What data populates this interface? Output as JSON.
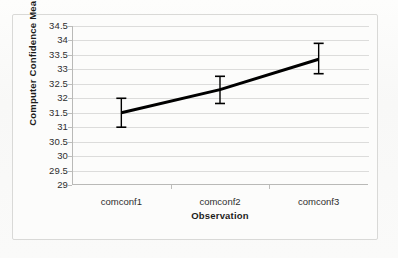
{
  "figure": {
    "background_color": "#fbfbfa",
    "frame_color": "#d9d9d7"
  },
  "chart_data": {
    "type": "line",
    "title": "",
    "xlabel": "Observation",
    "ylabel": "Computer Confidence Means",
    "categories": [
      "comconf1",
      "comconf2",
      "comconf3"
    ],
    "values": [
      31.5,
      32.3,
      33.35
    ],
    "series": [
      {
        "name": "Computer Confidence Means",
        "values": [
          31.5,
          32.3,
          33.35
        ],
        "error_low": [
          31.0,
          31.82,
          32.85
        ],
        "error_high": [
          32.0,
          32.76,
          33.9
        ],
        "error_bars": [
          0.5,
          0.47,
          0.52
        ],
        "color": "#000000",
        "line_width": 3
      }
    ],
    "ylim": [
      29,
      34.5
    ],
    "ytick_values": [
      29,
      29.5,
      30,
      30.5,
      31,
      31.5,
      32,
      32.5,
      33,
      33.5,
      34,
      34.5
    ],
    "ytick_labels": [
      "29",
      "29.5",
      "30",
      "30.5",
      "31",
      "31.5",
      "32",
      "32.5",
      "33",
      "33.5",
      "34",
      "34.5"
    ],
    "xtick_labels": [
      "comconf1",
      "comconf2",
      "comconf3"
    ],
    "grid": {
      "horizontal": true,
      "vertical": false,
      "color": "#dcdcdb"
    },
    "legend": {
      "visible": false,
      "position": "none"
    },
    "axis_color": "#b9b9b7"
  }
}
